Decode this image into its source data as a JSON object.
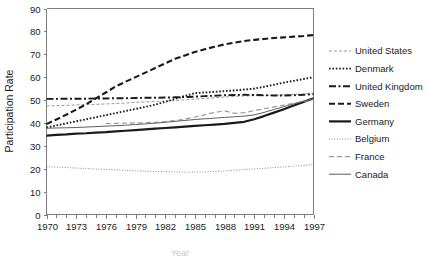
{
  "chart_data": {
    "type": "line",
    "title": "",
    "xlabel": "Year",
    "ylabel": "Participation Rate",
    "xlim": [
      1970,
      1997
    ],
    "ylim": [
      0,
      90
    ],
    "yticks": [
      0,
      10,
      20,
      30,
      40,
      50,
      60,
      70,
      80,
      90
    ],
    "xticks": [
      1970,
      1973,
      1976,
      1979,
      1982,
      1985,
      1988,
      1991,
      1994,
      1997
    ],
    "xtick_labels": [
      "1970",
      "1973",
      "1976",
      "1979",
      "1982",
      "1985",
      "1988",
      "1991",
      "1994",
      "1997"
    ],
    "ytick_labels": [
      "0",
      "10",
      "20",
      "30",
      "40",
      "50",
      "60",
      "70",
      "80",
      "90"
    ],
    "x_minor_tick_step": 1,
    "grid": false,
    "legend_position": "right",
    "x": [
      1970,
      1971,
      1972,
      1973,
      1974,
      1975,
      1976,
      1977,
      1978,
      1979,
      1980,
      1981,
      1982,
      1983,
      1984,
      1985,
      1986,
      1987,
      1988,
      1989,
      1990,
      1991,
      1992,
      1993,
      1994,
      1995,
      1996,
      1997
    ],
    "series": [
      {
        "name": "United States",
        "style": "light-dashed",
        "color": "#9a9a9a",
        "width": 1,
        "dash": "3,2",
        "values": [
          47.4,
          47.6,
          47.7,
          47.9,
          48.0,
          48.1,
          48.3,
          48.5,
          48.7,
          49.0,
          49.2,
          49.4,
          49.6,
          49.8,
          50.1,
          50.4,
          50.7,
          51.0,
          51.3,
          51.6,
          51.8,
          51.9,
          52.0,
          52.1,
          52.3,
          52.5,
          52.7,
          53.0
        ]
      },
      {
        "name": "Denmark",
        "style": "dotted",
        "color": "#1a1a1a",
        "width": 1.9,
        "dash": "1.6,1.8",
        "values": [
          38.0,
          38.9,
          39.8,
          40.7,
          41.6,
          42.5,
          43.4,
          44.3,
          45.2,
          46.1,
          47.0,
          48.0,
          49.2,
          50.5,
          51.8,
          53.0,
          53.3,
          53.6,
          53.9,
          54.2,
          54.6,
          55.0,
          55.8,
          56.7,
          57.6,
          58.4,
          59.2,
          60.0
        ]
      },
      {
        "name": "United Kingdom",
        "style": "dash-dot",
        "color": "#1a1a1a",
        "width": 1.9,
        "dash": "7,2.5,2,2.5",
        "values": [
          50.5,
          50.5,
          50.6,
          50.6,
          50.6,
          50.7,
          50.7,
          50.8,
          50.8,
          50.9,
          51.0,
          51.0,
          51.1,
          51.2,
          51.3,
          51.5,
          51.7,
          51.9,
          52.1,
          52.2,
          52.3,
          52.2,
          52.1,
          52.0,
          52.0,
          52.1,
          52.3,
          52.6
        ]
      },
      {
        "name": "Sweden",
        "style": "dashed",
        "color": "#1a1a1a",
        "width": 2.1,
        "dash": "6,3",
        "values": [
          39.5,
          41.5,
          43.6,
          45.8,
          48.2,
          50.7,
          53.3,
          56.0,
          58.0,
          60.0,
          62.0,
          64.0,
          66.0,
          68.0,
          69.5,
          71.0,
          72.2,
          73.3,
          74.3,
          75.1,
          75.8,
          76.3,
          76.7,
          77.1,
          77.4,
          77.7,
          78.0,
          78.4
        ]
      },
      {
        "name": "Germany",
        "style": "solid-bold",
        "color": "#1a1a1a",
        "width": 2.2,
        "dash": "",
        "values": [
          34.5,
          34.8,
          35.0,
          35.3,
          35.5,
          35.8,
          36.0,
          36.3,
          36.6,
          36.9,
          37.2,
          37.5,
          37.8,
          38.1,
          38.4,
          38.7,
          39.0,
          39.3,
          39.6,
          40.0,
          40.5,
          41.6,
          43.0,
          44.5,
          46.0,
          47.6,
          49.2,
          50.8
        ]
      },
      {
        "name": "Belgium",
        "style": "fine-dotted",
        "color": "#8d8d8d",
        "width": 1,
        "dash": "1,1.6",
        "values": [
          20.9,
          20.7,
          20.5,
          20.3,
          20.1,
          19.9,
          19.7,
          19.5,
          19.3,
          19.1,
          18.9,
          18.8,
          18.7,
          18.6,
          18.5,
          18.5,
          18.6,
          18.8,
          19.0,
          19.3,
          19.6,
          19.9,
          20.2,
          20.5,
          20.8,
          21.1,
          21.4,
          21.8
        ]
      },
      {
        "name": "France",
        "style": "grey-dashed",
        "color": "#9a9a9a",
        "width": 1.2,
        "dash": "5,3",
        "values": [
          null,
          null,
          null,
          null,
          null,
          null,
          39.7,
          39.8,
          39.9,
          40.0,
          40.1,
          40.3,
          40.6,
          41.0,
          41.7,
          42.6,
          43.6,
          44.6,
          45.3,
          44.2,
          44.5,
          45.4,
          46.2,
          47.0,
          47.8,
          48.6,
          49.4,
          50.2
        ]
      },
      {
        "name": "Canada",
        "style": "solid-thin",
        "color": "#5f5f5f",
        "width": 1,
        "dash": "",
        "values": [
          37.7,
          37.8,
          37.9,
          38.0,
          38.2,
          38.4,
          38.6,
          38.8,
          39.0,
          39.3,
          39.6,
          39.9,
          40.3,
          40.7,
          41.1,
          41.5,
          41.8,
          42.1,
          42.4,
          42.7,
          43.0,
          43.5,
          44.6,
          45.9,
          47.1,
          48.3,
          49.5,
          50.6
        ]
      }
    ]
  },
  "legend": {
    "items": [
      {
        "label": "United States"
      },
      {
        "label": "Denmark"
      },
      {
        "label": "United Kingdom"
      },
      {
        "label": "Sweden"
      },
      {
        "label": "Germany"
      },
      {
        "label": "Belgium"
      },
      {
        "label": "France"
      },
      {
        "label": "Canada"
      }
    ]
  }
}
